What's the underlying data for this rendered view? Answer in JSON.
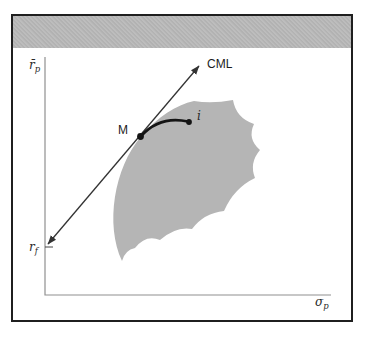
{
  "figure": {
    "header": {
      "bar_color": "#b9b9b9"
    },
    "labels": {
      "cml": "CML",
      "market_point": "M",
      "asset_point": "i"
    },
    "axis": {
      "y_base": "r̄",
      "y_sub": "p",
      "x_base": "σ",
      "x_sub": "p",
      "riskfree_base": "r",
      "riskfree_sub": "f"
    },
    "colors": {
      "frame": "#1f1f1f",
      "header_bar": "#b9b9b9",
      "region": "#b5b5b5",
      "cml_line": "#333333",
      "axis_line": "#909090",
      "curve": "#141414"
    }
  }
}
